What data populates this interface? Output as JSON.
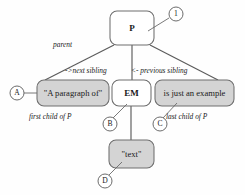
{
  "diagram": {
    "colors": {
      "node_fill_empty": "#ffffff",
      "node_fill_text": "#d4d4d4",
      "stroke": "#6e6e6e",
      "edge": "#5b5b5b",
      "label_text": "#1a1a1a"
    },
    "nodes": [
      {
        "id": "p",
        "label": "P",
        "kind": "element",
        "filled": false,
        "x": 110,
        "y": 11,
        "w": 44,
        "h": 34
      },
      {
        "id": "first-text",
        "label": "\"A paragraph of\"",
        "kind": "text",
        "filled": true,
        "x": 37,
        "y": 80,
        "w": 72,
        "h": 26
      },
      {
        "id": "em",
        "label": "EM",
        "kind": "element",
        "filled": false,
        "x": 112,
        "y": 80,
        "w": 39,
        "h": 26
      },
      {
        "id": "last-text",
        "label": "is just an example",
        "kind": "text",
        "filled": true,
        "x": 155,
        "y": 80,
        "w": 79,
        "h": 26
      },
      {
        "id": "em-text",
        "label": "\"text\"",
        "kind": "text",
        "filled": true,
        "x": 109,
        "y": 140,
        "w": 45,
        "h": 28
      }
    ],
    "edge_labels": [
      {
        "id": "parent",
        "text": "parent",
        "x": 53,
        "y": 47
      },
      {
        "id": "next-sibling",
        "text": "->next sibling",
        "x": 65,
        "y": 73
      },
      {
        "id": "previous-sibling",
        "text": "<- previous sibling",
        "x": 131,
        "y": 73
      },
      {
        "id": "first-child",
        "text": "first child of P",
        "x": 29,
        "y": 119
      },
      {
        "id": "last-child",
        "text": "last child of P",
        "x": 166,
        "y": 119
      }
    ],
    "markers": [
      {
        "id": "marker-1",
        "letter": "1",
        "cx": 176,
        "cy": 14,
        "r": 7
      },
      {
        "id": "marker-a",
        "letter": "A",
        "cx": 17,
        "cy": 93,
        "r": 7
      },
      {
        "id": "marker-b",
        "letter": "B",
        "cx": 110,
        "cy": 124,
        "r": 7
      },
      {
        "id": "marker-c",
        "letter": "C",
        "cx": 160,
        "cy": 124,
        "r": 7
      },
      {
        "id": "marker-d",
        "letter": "D",
        "cx": 105,
        "cy": 181,
        "r": 7
      }
    ]
  }
}
